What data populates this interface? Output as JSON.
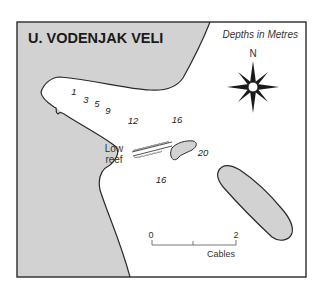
{
  "map": {
    "title": "U. VODENJAK VELI",
    "legend": "Depths in Metres",
    "north_label": "N",
    "reef_label_line1": "Low",
    "reef_label_line2": "reef",
    "depths": [
      {
        "value": "1",
        "x": 74,
        "y": 95
      },
      {
        "value": "3",
        "x": 86,
        "y": 103
      },
      {
        "value": "5",
        "x": 97,
        "y": 107
      },
      {
        "value": "9",
        "x": 108,
        "y": 114
      },
      {
        "value": "12",
        "x": 133,
        "y": 124
      },
      {
        "value": "16",
        "x": 177,
        "y": 123
      },
      {
        "value": "20",
        "x": 203,
        "y": 156
      },
      {
        "value": "16",
        "x": 161,
        "y": 183
      }
    ],
    "scale": {
      "start_label": "0",
      "end_label": "2",
      "unit_label": "Cables"
    },
    "colors": {
      "land": "#d2d2d2",
      "water": "#ffffff",
      "outline": "#2a2a2a",
      "text": "#1a1a1a"
    }
  }
}
